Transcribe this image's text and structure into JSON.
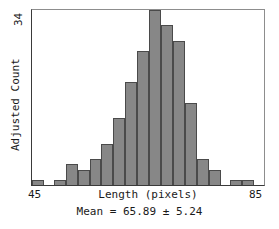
{
  "chart_data": {
    "type": "bar",
    "title": "",
    "subtitle": "Mean = 65.89 ± 5.24",
    "xlabel": "Length (pixels)",
    "ylabel": "Adjusted Count",
    "grid": false,
    "legend": null,
    "xlim": [
      45,
      85
    ],
    "ylim": [
      0,
      34
    ],
    "xtick_labels": [
      "45",
      "85"
    ],
    "ytick_labels": [
      "34"
    ],
    "bin_width": 2,
    "categories": [
      "45-47",
      "47-49",
      "49-51",
      "51-53",
      "53-55",
      "55-57",
      "57-59",
      "59-61",
      "61-63",
      "63-65",
      "65-67",
      "67-69",
      "69-71",
      "71-73",
      "73-75",
      "75-77",
      "77-79",
      "79-81",
      "81-83",
      "83-85"
    ],
    "values": [
      1,
      0,
      1,
      4,
      3,
      5,
      8,
      13,
      20,
      26,
      34,
      31,
      28,
      16,
      5,
      3,
      0,
      1,
      1,
      0
    ]
  },
  "axes": {
    "y_max_label": "34",
    "y_axis_label": "Adjusted Count",
    "x_min_label": "45",
    "x_max_label": "85",
    "x_axis_label": "Length (pixels)"
  },
  "caption": "Mean = 65.89 ± 5.24",
  "colors": {
    "bar_fill": "#878787",
    "bar_edge": "#4a4a4a",
    "axis": "#3a3a3a",
    "background": "#ffffff"
  }
}
